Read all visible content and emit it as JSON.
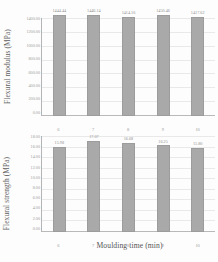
{
  "figure": {
    "background": "#fdfdfd",
    "bar_color": "#a9a9a9",
    "x_axis_title": "Moulding time (min)"
  },
  "chart_data": [
    {
      "type": "bar",
      "title": "",
      "xlabel": "Moulding time (min)",
      "ylabel": "Flexural modulus (MPa)",
      "categories": [
        "6",
        "7",
        "8",
        "9",
        "10"
      ],
      "values": [
        1444.44,
        1446.14,
        1414.16,
        1450.46,
        1417.62
      ],
      "data_labels": [
        "1444.44",
        "1446.14",
        "1414.16",
        "1450.46",
        "1417.62"
      ],
      "ylim": [
        0,
        1400
      ],
      "ytick_labels": [
        "1400.00",
        "1200.00",
        "1000.00",
        "800.00",
        "600.00",
        "400.00",
        "200.00",
        "0.00"
      ],
      "grid": true,
      "legend": "none"
    },
    {
      "type": "bar",
      "title": "",
      "xlabel": "Moulding time (min)",
      "ylabel": "Flexural strength (MPa)",
      "categories": [
        "6",
        "7",
        "8",
        "9",
        "10"
      ],
      "values": [
        15.98,
        17.07,
        16.68,
        16.25,
        15.8
      ],
      "data_labels": [
        "15.98",
        "17.07",
        "16.68",
        "16.25",
        "15.80"
      ],
      "ylim": [
        0,
        18
      ],
      "ytick_labels": [
        "18.00",
        "16.00",
        "14.00",
        "12.00",
        "10.00",
        "8.00",
        "6.00",
        "4.00",
        "2.00",
        "0.00"
      ],
      "grid": true,
      "legend": "none"
    }
  ]
}
